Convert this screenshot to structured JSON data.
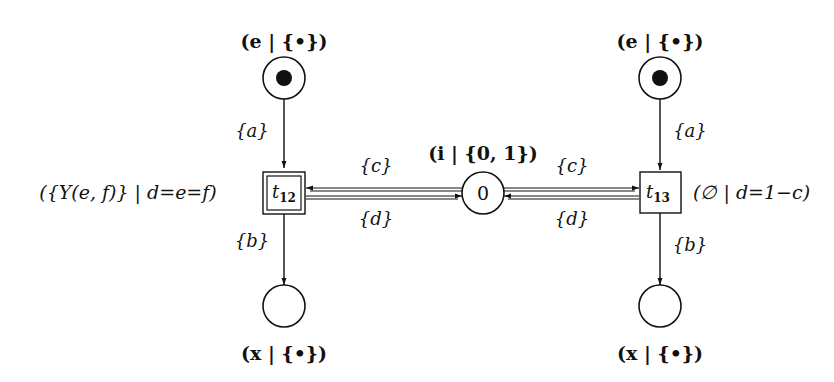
{
  "diagram": {
    "type": "petri-net",
    "places": {
      "e_left": {
        "label": "(e | {•})",
        "marked": true
      },
      "e_right": {
        "label": "(e | {•})",
        "marked": true
      },
      "i_center": {
        "label": "(i | {0, 1})",
        "value": "0"
      },
      "x_left": {
        "label": "(x | {•})",
        "marked": false
      },
      "x_right": {
        "label": "(x | {•})",
        "marked": false
      }
    },
    "transitions": {
      "t12": {
        "name": "t",
        "subscript": "12",
        "annotation": "({Y(e, f)} | d=e=f)",
        "style": "double-border"
      },
      "t13": {
        "name": "t",
        "subscript": "13",
        "annotation": "(∅ | d=1−c)",
        "style": "single-border"
      }
    },
    "arcs": {
      "e_left_to_t12": "{a}",
      "t12_to_x_left": "{b}",
      "i_to_t12": "{c}",
      "t12_to_i": "{d}",
      "e_right_to_t13": "{a}",
      "t13_to_x_right": "{b}",
      "i_to_t13": "{c}",
      "t13_to_i": "{d}"
    }
  }
}
